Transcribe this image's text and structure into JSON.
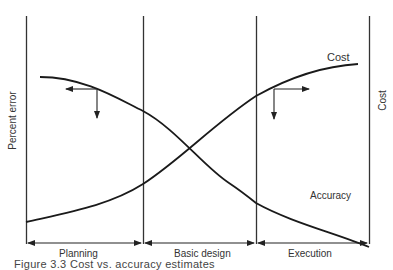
{
  "diagram": {
    "left_axis_label": "Percent error",
    "right_axis_label": "Cost",
    "curves": [
      {
        "name": "Cost",
        "label": "Cost",
        "trend": "increasing"
      },
      {
        "name": "Accuracy",
        "label": "Accuracy",
        "trend": "decreasing"
      }
    ],
    "phases": [
      {
        "label": "Planning"
      },
      {
        "label": "Basic design"
      },
      {
        "label": "Execution"
      }
    ],
    "caption": "Figure 3.3  Cost vs. accuracy estimates"
  }
}
